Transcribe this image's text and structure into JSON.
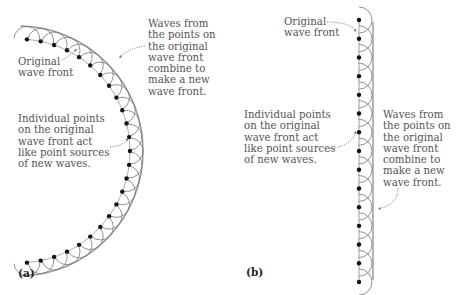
{
  "figure_a": {
    "panel_label": "(a)",
    "label_original": "Original\nwave front",
    "label_waves": "Waves from\nthe points on\nthe original\nwave front\ncombine to\nmake a new\nwave front.",
    "label_points": "Individual points\non the original\nwave front act\nlike point sources\nof new waves."
  },
  "figure_b": {
    "panel_label": "(b)",
    "label_original": "Original\nwave front",
    "label_points": "Individual points\non the original\nwave front act\nlike point sources\nof new waves.",
    "label_waves": "Waves from\nthe points on\nthe original\nwave front\ncombine to\nmake a new\nwave front."
  },
  "colors": {
    "dots": "#111111",
    "curves": "#777777",
    "front": "#999999",
    "text": "#555555",
    "arrow": "#777777"
  }
}
